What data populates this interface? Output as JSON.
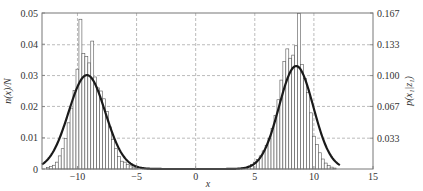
{
  "chart_data": {
    "type": "bar",
    "title": "",
    "xlabel": "x",
    "ylabel": "n(x)/N",
    "y2label": "p(x₁|z₁)",
    "xlim": [
      -13,
      15
    ],
    "ylim": [
      0,
      0.05
    ],
    "y2lim": [
      0,
      0.167
    ],
    "grid": true,
    "x_ticks": [
      -10,
      -5,
      0,
      5,
      10,
      15
    ],
    "x_tick_labels": [
      "−10",
      "−5",
      "0",
      "5",
      "10",
      "15"
    ],
    "y_ticks": [
      0,
      0.01,
      0.02,
      0.03,
      0.04,
      0.05
    ],
    "y_tick_labels": [
      "0",
      "0.01",
      "0.02",
      "0.03",
      "0.04",
      "0.05"
    ],
    "y2_ticks": [
      0.033,
      0.067,
      0.1,
      0.133,
      0.167
    ],
    "y2_tick_labels": [
      "0.033",
      "0.067",
      "0.100",
      "0.133",
      "0.167"
    ],
    "histogram": {
      "bin_width": 0.25,
      "bins": [
        {
          "x": -12.5,
          "h": 0.0005
        },
        {
          "x": -12.25,
          "h": 0.0008
        },
        {
          "x": -12.0,
          "h": 0.0012
        },
        {
          "x": -11.75,
          "h": 0.0022
        },
        {
          "x": -11.5,
          "h": 0.0042
        },
        {
          "x": -11.25,
          "h": 0.0065
        },
        {
          "x": -11.0,
          "h": 0.0098
        },
        {
          "x": -10.75,
          "h": 0.0148
        },
        {
          "x": -10.5,
          "h": 0.0195
        },
        {
          "x": -10.25,
          "h": 0.0252
        },
        {
          "x": -10.0,
          "h": 0.032
        },
        {
          "x": -9.75,
          "h": 0.048
        },
        {
          "x": -9.5,
          "h": 0.037
        },
        {
          "x": -9.25,
          "h": 0.036
        },
        {
          "x": -9.0,
          "h": 0.034
        },
        {
          "x": -8.75,
          "h": 0.041
        },
        {
          "x": -8.5,
          "h": 0.0295
        },
        {
          "x": -8.25,
          "h": 0.026
        },
        {
          "x": -8.0,
          "h": 0.025
        },
        {
          "x": -7.75,
          "h": 0.0225
        },
        {
          "x": -7.5,
          "h": 0.0185
        },
        {
          "x": -7.25,
          "h": 0.0135
        },
        {
          "x": -7.0,
          "h": 0.0095
        },
        {
          "x": -6.75,
          "h": 0.0065
        },
        {
          "x": -6.5,
          "h": 0.004
        },
        {
          "x": -6.25,
          "h": 0.0025
        },
        {
          "x": -6.0,
          "h": 0.0022
        },
        {
          "x": -5.75,
          "h": 0.0015
        },
        {
          "x": -5.5,
          "h": 0.001
        },
        {
          "x": -5.25,
          "h": 0.0006
        },
        {
          "x": -5.0,
          "h": 0.0004
        },
        {
          "x": 4.0,
          "h": 0.0003
        },
        {
          "x": 4.25,
          "h": 0.0005
        },
        {
          "x": 4.5,
          "h": 0.0009
        },
        {
          "x": 4.75,
          "h": 0.0015
        },
        {
          "x": 5.0,
          "h": 0.0022
        },
        {
          "x": 5.25,
          "h": 0.003
        },
        {
          "x": 5.5,
          "h": 0.0042
        },
        {
          "x": 5.75,
          "h": 0.0058
        },
        {
          "x": 6.0,
          "h": 0.0075
        },
        {
          "x": 6.25,
          "h": 0.0098
        },
        {
          "x": 6.5,
          "h": 0.013
        },
        {
          "x": 6.75,
          "h": 0.0172
        },
        {
          "x": 7.0,
          "h": 0.0222
        },
        {
          "x": 7.25,
          "h": 0.0285
        },
        {
          "x": 7.5,
          "h": 0.0345
        },
        {
          "x": 7.75,
          "h": 0.0385
        },
        {
          "x": 8.0,
          "h": 0.0355
        },
        {
          "x": 8.25,
          "h": 0.0365
        },
        {
          "x": 8.5,
          "h": 0.0395
        },
        {
          "x": 8.75,
          "h": 0.0498
        },
        {
          "x": 9.0,
          "h": 0.0335
        },
        {
          "x": 9.25,
          "h": 0.029
        },
        {
          "x": 9.5,
          "h": 0.0245
        },
        {
          "x": 9.75,
          "h": 0.018
        },
        {
          "x": 10.0,
          "h": 0.0105
        },
        {
          "x": 10.25,
          "h": 0.0078
        },
        {
          "x": 10.5,
          "h": 0.0052
        },
        {
          "x": 10.75,
          "h": 0.0032
        },
        {
          "x": 11.0,
          "h": 0.0019
        },
        {
          "x": 11.25,
          "h": 0.0011
        },
        {
          "x": 11.5,
          "h": 0.0006
        },
        {
          "x": 11.75,
          "h": 0.0003
        }
      ]
    },
    "curve": {
      "name": "p(x₁|z₁)",
      "components": [
        {
          "mean": -9.2,
          "sd": 1.55,
          "peak": 0.0301
        },
        {
          "mean": 8.5,
          "sd": 1.45,
          "peak": 0.033
        }
      ],
      "x_range": [
        -13,
        12.2
      ]
    }
  }
}
